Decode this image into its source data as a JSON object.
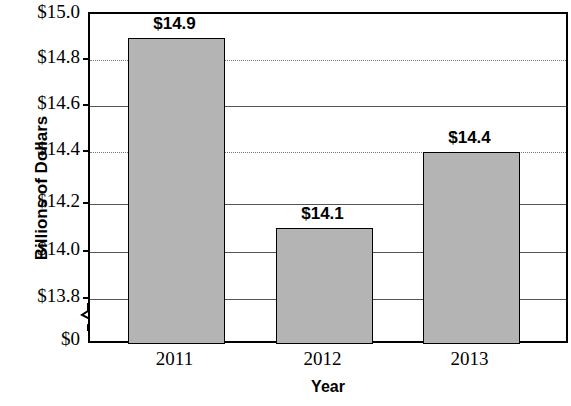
{
  "chart_data": {
    "type": "bar",
    "title": "",
    "xlabel": "Year",
    "ylabel": "Billions of Dollars",
    "categories": [
      "2011",
      "2012",
      "2013"
    ],
    "values": [
      14.9,
      14.1,
      14.4
    ],
    "data_labels": [
      "$14.9",
      "$14.1",
      "$14.4"
    ],
    "ylim": [
      13.7,
      15.0
    ],
    "y_ticks": [
      {
        "value": 15.0,
        "label": "$15.0",
        "gridline": "none",
        "y": 13
      },
      {
        "value": 14.8,
        "label": "$14.8",
        "gridline": "dotted",
        "y": 58
      },
      {
        "value": 14.6,
        "label": "$14.6",
        "gridline": "solid",
        "y": 104
      },
      {
        "value": 14.4,
        "label": "$14.4",
        "gridline": "dotted",
        "y": 150
      },
      {
        "value": 14.2,
        "label": "$14.2",
        "gridline": "solid",
        "y": 202
      },
      {
        "value": 14.0,
        "label": "$14.0",
        "gridline": "solid",
        "y": 250
      },
      {
        "value": 13.8,
        "label": "$13.8",
        "gridline": "solid",
        "y": 297
      },
      {
        "value": 0.0,
        "label": "$0",
        "gridline": "none",
        "y": 340
      }
    ],
    "axis_break": true,
    "grid": true,
    "legend": "none",
    "bar_fill_color": "#b4b4b4",
    "bar_border_color": "#000000",
    "axis_color": "#000000",
    "background_color": "#ffffff",
    "bars": [
      {
        "category": "2011",
        "label": "$14.9",
        "x": 126,
        "width": 97,
        "top": 36,
        "height": 306,
        "label_x": 126,
        "label_y": 14
      },
      {
        "category": "2012",
        "label": "$14.1",
        "x": 274,
        "width": 97,
        "top": 226,
        "height": 116,
        "label_x": 274,
        "label_y": 204
      },
      {
        "category": "2013",
        "label": "$14.4",
        "x": 421,
        "width": 97,
        "top": 150,
        "height": 192,
        "label_x": 421,
        "label_y": 128
      }
    ]
  }
}
